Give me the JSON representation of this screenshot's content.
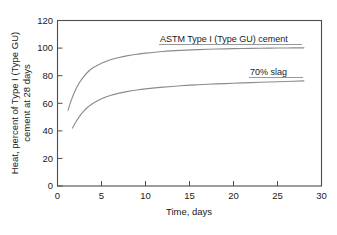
{
  "chart_data": {
    "type": "line",
    "title": "",
    "xlabel": "Time, days",
    "ylabel": "Heat, percent of Type I (Type GU) cement at 28 days",
    "ylabel_line1": "Heat, percent of Type I (Type GU)",
    "ylabel_line2": "cement at 28 days",
    "xlim": [
      0,
      30
    ],
    "ylim": [
      0,
      120
    ],
    "xticks": [
      0,
      5,
      10,
      15,
      20,
      25,
      30
    ],
    "yticks": [
      0,
      20,
      40,
      60,
      80,
      100,
      120
    ],
    "xtick_labels": [
      "0",
      "5",
      "10",
      "15",
      "20",
      "25",
      "30"
    ],
    "ytick_labels": [
      "0",
      "20",
      "40",
      "60",
      "80",
      "100",
      "120"
    ],
    "grid": false,
    "legend_position": "inline-annotation",
    "line_color": "#8c8c8c",
    "axis_color": "#4d4d4d",
    "text_color": "#1a1a1a",
    "series": [
      {
        "name": "ASTM Type I (Type GU) cement",
        "annotation": "ASTM Type I (Type GU) cement",
        "x": [
          1.2,
          1.5,
          2,
          2.5,
          3,
          3.5,
          4,
          5,
          6,
          7,
          8,
          9,
          10,
          12,
          14,
          16,
          18,
          20,
          22,
          24,
          26,
          28
        ],
        "y": [
          55,
          61,
          69,
          75,
          79.5,
          83,
          85.5,
          89,
          91.5,
          93.2,
          94.5,
          95.5,
          96.3,
          97.5,
          98.3,
          98.9,
          99.3,
          99.6,
          99.8,
          100,
          100.1,
          100.2
        ]
      },
      {
        "name": "70% slag",
        "annotation": "70% slag",
        "x": [
          1.7,
          2,
          2.5,
          3,
          3.5,
          4,
          5,
          6,
          7,
          8,
          9,
          10,
          12,
          14,
          16,
          18,
          20,
          22,
          24,
          26,
          28
        ],
        "y": [
          42,
          45.5,
          50.5,
          54.5,
          57.5,
          59.8,
          63.3,
          65.6,
          67.3,
          68.6,
          69.6,
          70.4,
          71.7,
          72.7,
          73.4,
          74,
          74.5,
          75,
          75.4,
          75.8,
          76.2
        ]
      }
    ]
  },
  "annotations": {
    "upper_label": "ASTM Type I (Type GU) cement",
    "lower_label": "70% slag"
  }
}
